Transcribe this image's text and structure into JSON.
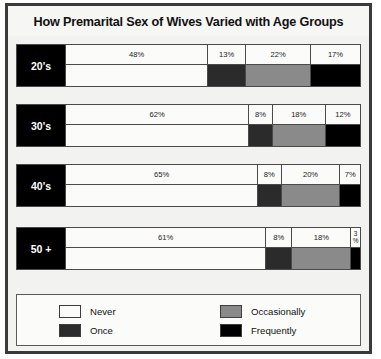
{
  "chart_data": {
    "type": "bar",
    "title": "How Premarital Sex of Wives Varied with Age Groups",
    "xlabel": "",
    "ylabel": "",
    "categories": [
      "20's",
      "30's",
      "40's",
      "50 +"
    ],
    "series": [
      {
        "name": "Never",
        "color": "#fbfbfa",
        "values": [
          48,
          62,
          65,
          61
        ]
      },
      {
        "name": "Once",
        "color": "#2b2b2b",
        "values": [
          13,
          8,
          8,
          8
        ]
      },
      {
        "name": "Occasionally",
        "color": "#8a8a8a",
        "values": [
          22,
          18,
          20,
          18
        ]
      },
      {
        "name": "Frequently",
        "color": "#000000",
        "values": [
          17,
          12,
          7,
          3
        ]
      }
    ],
    "value_suffix": "%",
    "legend_position": "bottom",
    "grid": false
  },
  "rows": [
    {
      "label": "20's",
      "segments": [
        {
          "label": "48%",
          "value": 48,
          "series": "Never",
          "color": "#fbfbfa"
        },
        {
          "label": "13%",
          "value": 13,
          "series": "Once",
          "color": "#2b2b2b"
        },
        {
          "label": "22%",
          "value": 22,
          "series": "Occasionally",
          "color": "#8a8a8a"
        },
        {
          "label": "17%",
          "value": 17,
          "series": "Frequently",
          "color": "#000000"
        }
      ]
    },
    {
      "label": "30's",
      "segments": [
        {
          "label": "62%",
          "value": 62,
          "series": "Never",
          "color": "#fbfbfa"
        },
        {
          "label": "8%",
          "value": 8,
          "series": "Once",
          "color": "#2b2b2b"
        },
        {
          "label": "18%",
          "value": 18,
          "series": "Occasionally",
          "color": "#8a8a8a"
        },
        {
          "label": "12%",
          "value": 12,
          "series": "Frequently",
          "color": "#000000"
        }
      ]
    },
    {
      "label": "40's",
      "segments": [
        {
          "label": "65%",
          "value": 65,
          "series": "Never",
          "color": "#fbfbfa"
        },
        {
          "label": "8%",
          "value": 8,
          "series": "Once",
          "color": "#2b2b2b"
        },
        {
          "label": "20%",
          "value": 20,
          "series": "Occasionally",
          "color": "#8a8a8a"
        },
        {
          "label": "7%",
          "value": 7,
          "series": "Frequently",
          "color": "#000000"
        }
      ]
    },
    {
      "label": "50 +",
      "segments": [
        {
          "label": "61%",
          "value": 61,
          "series": "Never",
          "color": "#fbfbfa"
        },
        {
          "label": "8%",
          "value": 8,
          "series": "Once",
          "color": "#2b2b2b"
        },
        {
          "label": "18%",
          "value": 18,
          "series": "Occasionally",
          "color": "#8a8a8a"
        },
        {
          "label": "3\n%",
          "value": 3,
          "series": "Frequently",
          "color": "#000000"
        }
      ]
    }
  ],
  "legend": {
    "columns": [
      [
        {
          "label": "Never",
          "color": "#fbfbfa"
        },
        {
          "label": "Once",
          "color": "#2b2b2b"
        }
      ],
      [
        {
          "label": "Occasionally",
          "color": "#8a8a8a"
        },
        {
          "label": "Frequently",
          "color": "#000000"
        }
      ]
    ]
  }
}
